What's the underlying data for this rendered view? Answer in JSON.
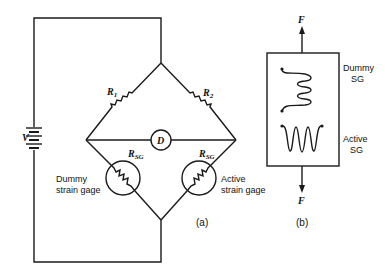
{
  "figure_a": {
    "source_label": "V",
    "r1_label": "R",
    "r1_sub": "1",
    "r2_label": "R",
    "r2_sub": "2",
    "detector_label": "D",
    "rsg_left_label": "R",
    "rsg_left_sub": "SG",
    "rsg_right_label": "R",
    "rsg_right_sub": "SG",
    "dummy_line1": "Dummy",
    "dummy_line2": "strain gage",
    "active_line1": "Active",
    "active_line2": "strain gage",
    "caption": "(a)"
  },
  "figure_b": {
    "force_top": "F",
    "force_bottom": "F",
    "dummy_line1": "Dummy",
    "dummy_line2": "SG",
    "active_line1": "Active",
    "active_line2": "SG",
    "caption": "(b)"
  },
  "colors": {
    "line": "#1a1a1a",
    "background": "#ffffff"
  }
}
